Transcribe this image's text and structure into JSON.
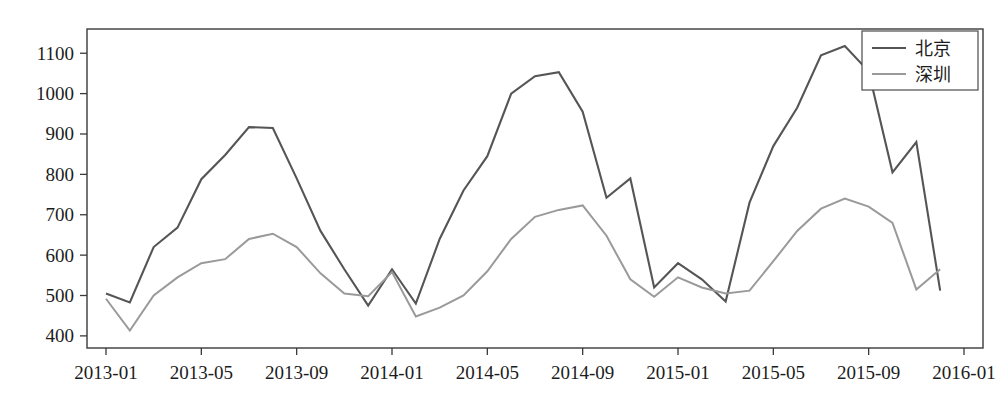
{
  "chart_data": {
    "type": "line",
    "title": "",
    "xlabel": "",
    "ylabel": "",
    "grid": false,
    "legend_position": "top-right",
    "ylim": [
      370,
      1160
    ],
    "yticks": [
      400,
      500,
      600,
      700,
      800,
      900,
      1000,
      1100
    ],
    "ytick_labels": [
      "400",
      "500",
      "600",
      "700",
      "800",
      "900",
      "1000",
      "1100"
    ],
    "xticks": [
      "2013-01",
      "2013-05",
      "2013-09",
      "2014-01",
      "2014-05",
      "2014-09",
      "2015-01",
      "2015-05",
      "2015-09",
      "2016-01"
    ],
    "x": [
      "2013-01",
      "2013-02",
      "2013-03",
      "2013-04",
      "2013-05",
      "2013-06",
      "2013-07",
      "2013-08",
      "2013-09",
      "2013-10",
      "2013-11",
      "2013-12",
      "2014-01",
      "2014-02",
      "2014-03",
      "2014-04",
      "2014-05",
      "2014-06",
      "2014-07",
      "2014-08",
      "2014-09",
      "2014-10",
      "2014-11",
      "2014-12",
      "2015-01",
      "2015-02",
      "2015-03",
      "2015-04",
      "2015-05",
      "2015-06",
      "2015-07",
      "2015-08",
      "2015-09",
      "2015-10",
      "2015-11",
      "2015-12"
    ],
    "series": [
      {
        "name": "北京",
        "color": "#555555",
        "width": 2.1,
        "values": [
          505,
          483,
          620,
          668,
          788,
          848,
          917,
          915,
          790,
          660,
          565,
          475,
          565,
          480,
          640,
          760,
          845,
          1000,
          1043,
          1053,
          955,
          742,
          790,
          520,
          580,
          540,
          485,
          730,
          870,
          965,
          1095,
          1118,
          1055,
          805,
          880,
          512
        ]
      },
      {
        "name": "深圳",
        "color": "#9a9a9a",
        "width": 2.0,
        "values": [
          492,
          413,
          500,
          545,
          580,
          590,
          640,
          653,
          620,
          555,
          505,
          498,
          558,
          448,
          470,
          500,
          560,
          640,
          695,
          712,
          723,
          648,
          540,
          497,
          545,
          520,
          505,
          512,
          585,
          660,
          715,
          740,
          720,
          680,
          515,
          565
        ]
      }
    ]
  },
  "legend": {
    "entries": [
      {
        "label": "北京"
      },
      {
        "label": "深圳"
      }
    ]
  },
  "axes": {
    "x_tick_labels": [
      "2013-01",
      "2013-05",
      "2013-09",
      "2014-01",
      "2014-05",
      "2014-09",
      "2015-01",
      "2015-05",
      "2015-09",
      "2016-01"
    ],
    "y_tick_labels": [
      "1100",
      "1000",
      "900",
      "800",
      "700",
      "600",
      "500",
      "400"
    ]
  }
}
